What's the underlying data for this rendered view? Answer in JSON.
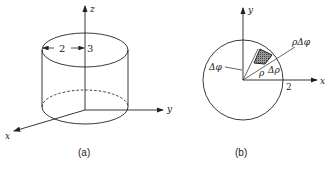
{
  "figure_a": {
    "caption": "(a)",
    "axes": {
      "z": "z",
      "y": "y",
      "x": "x"
    },
    "dimension_labels": {
      "radius": "2",
      "height": "3"
    }
  },
  "figure_b": {
    "caption": "(b)",
    "axes": {
      "y": "y",
      "x": "x"
    },
    "labels": {
      "delta_phi": "Δφ",
      "rho": "ρ",
      "delta_rho": "Δρ",
      "rho_delta_phi": "ρΔφ",
      "radius": "2"
    }
  },
  "colors": {
    "stroke": "#222222",
    "hatch": "#555555"
  }
}
